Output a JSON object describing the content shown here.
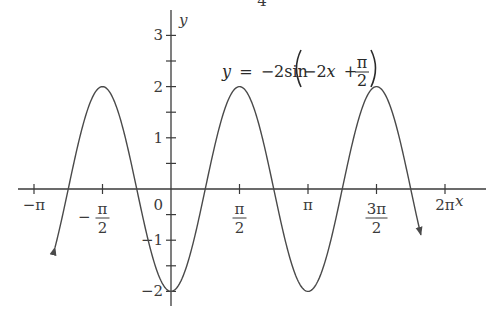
{
  "chart_data": {
    "type": "line",
    "title": "",
    "equation": {
      "lhs": "y",
      "equals": "=",
      "coef": "−2sin",
      "inner_prefix": "−2",
      "inner_var": "x",
      "plus": "+",
      "frac_num": "π",
      "frac_den": "2"
    },
    "top_fragment": "4",
    "xlabel": "x",
    "ylabel": "y",
    "xlim": [
      -3.35,
      7.35
    ],
    "ylim": [
      -2.3,
      3.5
    ],
    "grid": false,
    "x_ticks": [
      {
        "value": -3.14159,
        "label": "−π",
        "kind": "simple"
      },
      {
        "value": -1.5708,
        "label_num": "π",
        "label_den": "2",
        "sign": "−",
        "kind": "frac"
      },
      {
        "value": 1.5708,
        "label_num": "π",
        "label_den": "2",
        "sign": "",
        "kind": "frac"
      },
      {
        "value": 3.14159,
        "label": "π",
        "kind": "simple"
      },
      {
        "value": 4.71239,
        "label_num": "3π",
        "label_den": "2",
        "sign": "",
        "kind": "frac"
      },
      {
        "value": 6.28319,
        "label": "2π",
        "kind": "simple"
      }
    ],
    "origin_label": "0",
    "y_ticks": [
      {
        "value": 3,
        "label": "3"
      },
      {
        "value": 2.5,
        "label": ""
      },
      {
        "value": 2,
        "label": "2"
      },
      {
        "value": 1.5,
        "label": ""
      },
      {
        "value": 1,
        "label": "1"
      },
      {
        "value": 0.5,
        "label": ""
      },
      {
        "value": -0.5,
        "label": ""
      },
      {
        "value": -1,
        "label": "−1"
      },
      {
        "value": -1.5,
        "label": ""
      },
      {
        "value": -2,
        "label": "−2"
      }
    ],
    "series": [
      {
        "name": "y = −2sin(−2x + π/2)",
        "function": "-2*sin(-2*x + pi/2)",
        "x_start": -2.66,
        "x_end": 5.73,
        "arrow_ends": true,
        "key_points": [
          {
            "x": -1.5708,
            "y": 2
          },
          {
            "x": 0,
            "y": -2
          },
          {
            "x": 1.5708,
            "y": 2
          },
          {
            "x": 3.14159,
            "y": -2
          },
          {
            "x": 4.71239,
            "y": 2
          }
        ],
        "color": "#4a4a4a"
      }
    ],
    "axis_color": "#3a3a3a"
  }
}
